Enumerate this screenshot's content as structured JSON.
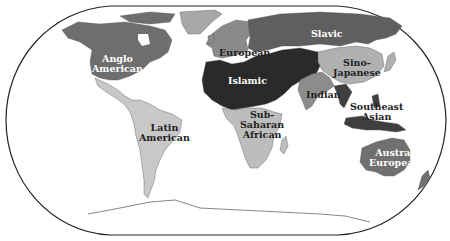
{
  "map": {
    "title": "World Culture Realms",
    "projection": "Robinson-like oval world map",
    "colors": {
      "ocean": "#ffffff",
      "anglo_american": "#6e6e6e",
      "latin_american": "#c8c8c8",
      "european": "#8a8a8a",
      "slavic": "#5f5f5f",
      "islamic": "#2a2a2a",
      "sub_saharan_african": "#bdbdbd",
      "indian": "#8c8c8c",
      "sino_japanese": "#b0b0b0",
      "southeast_asian": "#3f3f3f",
      "austral_european": "#707070",
      "greenland": "#a8a8a8",
      "antarctica": "#ffffff",
      "outline": "#222222"
    },
    "regions": [
      {
        "id": "anglo_american",
        "label_line1": "Anglo",
        "label_line2": "American"
      },
      {
        "id": "latin_american",
        "label_line1": "Latin",
        "label_line2": "American"
      },
      {
        "id": "european",
        "label_line1": "European",
        "label_line2": ""
      },
      {
        "id": "slavic",
        "label_line1": "Slavic",
        "label_line2": ""
      },
      {
        "id": "islamic",
        "label_line1": "Islamic",
        "label_line2": ""
      },
      {
        "id": "sub_saharan_african",
        "label_line1": "Sub-",
        "label_line2": "Saharan",
        "label_line3": "African"
      },
      {
        "id": "indian",
        "label_line1": "Indian",
        "label_line2": ""
      },
      {
        "id": "sino_japanese",
        "label_line1": "Sino-",
        "label_line2": "Japanese"
      },
      {
        "id": "southeast_asian",
        "label_line1": "Southeast",
        "label_line2": "Asian"
      },
      {
        "id": "austral_european",
        "label_line1": "Austral",
        "label_line2": "European"
      }
    ]
  }
}
